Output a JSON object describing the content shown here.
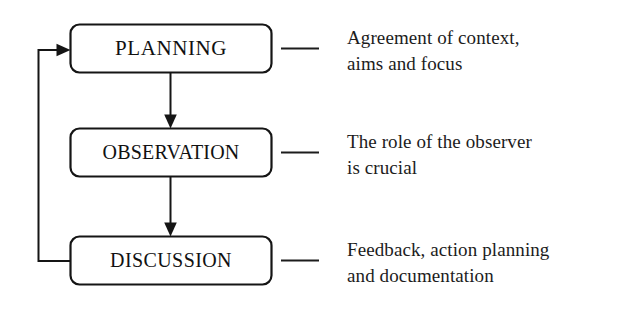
{
  "diagram": {
    "stroke_color": "#151515",
    "background_color": "#ffffff",
    "nodes": [
      {
        "id": "planning",
        "label": "PLANNING",
        "shape": "rounded-rectangle",
        "description_lines": [
          "Agreement of context,",
          "aims and focus"
        ],
        "description_text": "Agreement of context, aims and focus"
      },
      {
        "id": "observation",
        "label": "OBSERVATION",
        "shape": "rounded-rectangle",
        "description_lines": [
          "The role of the observer",
          "is crucial"
        ],
        "description_text": "The role of the observer is crucial"
      },
      {
        "id": "discussion",
        "label": "DISCUSSION",
        "shape": "rounded-rectangle",
        "description_lines": [
          "Feedback, action planning",
          "and documentation"
        ],
        "description_text": "Feedback, action planning and documentation"
      }
    ],
    "connectors": [
      {
        "id": "planning-to-observation",
        "from": "planning",
        "to": "observation",
        "style": "straight-arrow",
        "direction": "down"
      },
      {
        "id": "observation-to-discussion",
        "from": "observation",
        "to": "discussion",
        "style": "straight-arrow",
        "direction": "down"
      },
      {
        "id": "discussion-to-planning-feedback",
        "from": "discussion",
        "to": "planning",
        "style": "elbow-arrow",
        "direction": "left-up-right"
      }
    ],
    "leaders": [
      {
        "id": "leader-planning",
        "for": "planning",
        "style": "em-dash-rule"
      },
      {
        "id": "leader-observation",
        "for": "observation",
        "style": "em-dash-rule"
      },
      {
        "id": "leader-discussion",
        "for": "discussion",
        "style": "em-dash-rule"
      }
    ]
  }
}
